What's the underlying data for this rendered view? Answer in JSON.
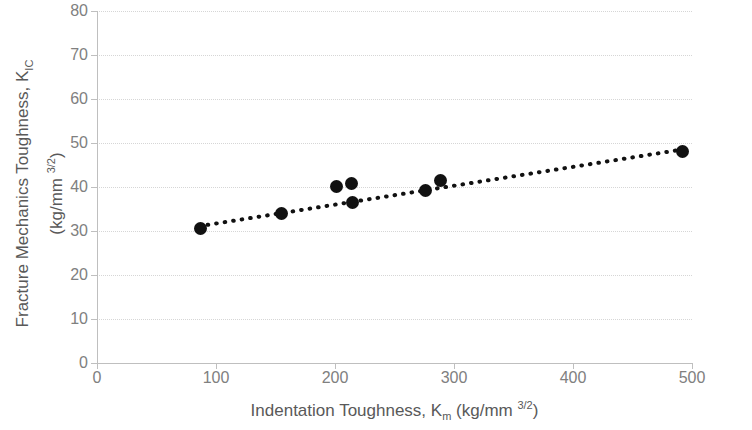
{
  "chart_data": {
    "type": "scatter",
    "title": "",
    "xlabel": "Indentation Toughness, K_m (kg/mm 3/2)",
    "ylabel": "Fracture Mechanics Toughness, K_IC (kg/mm 3/2)",
    "xlim": [
      0,
      500
    ],
    "ylim": [
      0,
      80
    ],
    "xticks": [
      0,
      100,
      200,
      300,
      400,
      500
    ],
    "yticks": [
      0,
      10,
      20,
      30,
      40,
      50,
      60,
      70,
      80
    ],
    "grid": true,
    "legend": "none",
    "marker_color": "#111111",
    "grid_color": "#d6d6d6",
    "axis_color": "#bfbfbf",
    "tick_label_color": "#808080",
    "axis_title_color": "#595959",
    "points": [
      {
        "x": 87,
        "y": 30.5
      },
      {
        "x": 155,
        "y": 33.9
      },
      {
        "x": 201,
        "y": 40.2
      },
      {
        "x": 214,
        "y": 40.9
      },
      {
        "x": 215,
        "y": 36.4
      },
      {
        "x": 276,
        "y": 39.3
      },
      {
        "x": 289,
        "y": 41.4
      },
      {
        "x": 492,
        "y": 48.0
      }
    ],
    "series": [
      {
        "name": "Data",
        "type": "scatter",
        "x": [
          87,
          155,
          201,
          214,
          215,
          276,
          289,
          492
        ],
        "values": [
          30.5,
          33.9,
          40.2,
          40.9,
          36.4,
          39.3,
          41.4,
          48.0
        ]
      },
      {
        "name": "Linear trendline",
        "type": "line",
        "style": "dotted",
        "x": [
          93,
          489
        ],
        "values": [
          31.4,
          48.4
        ]
      }
    ]
  },
  "axes": {
    "y": {
      "title_line1": "Fracture Mechanics Toughness, K",
      "title_line1_sub": "IC",
      "title_line2_prefix": "(kg/mm ",
      "title_line2_sup": "3/2",
      "title_line2_suffix": ")",
      "tick_labels": [
        "80",
        "70",
        "60",
        "50",
        "40",
        "30",
        "20",
        "10",
        "0"
      ]
    },
    "x": {
      "title_prefix": "Indentation Toughness, K",
      "title_sub": "m",
      "title_mid": " (kg/mm ",
      "title_sup": "3/2",
      "title_suffix": ")",
      "tick_labels": [
        "0",
        "100",
        "200",
        "300",
        "400",
        "500"
      ]
    }
  }
}
